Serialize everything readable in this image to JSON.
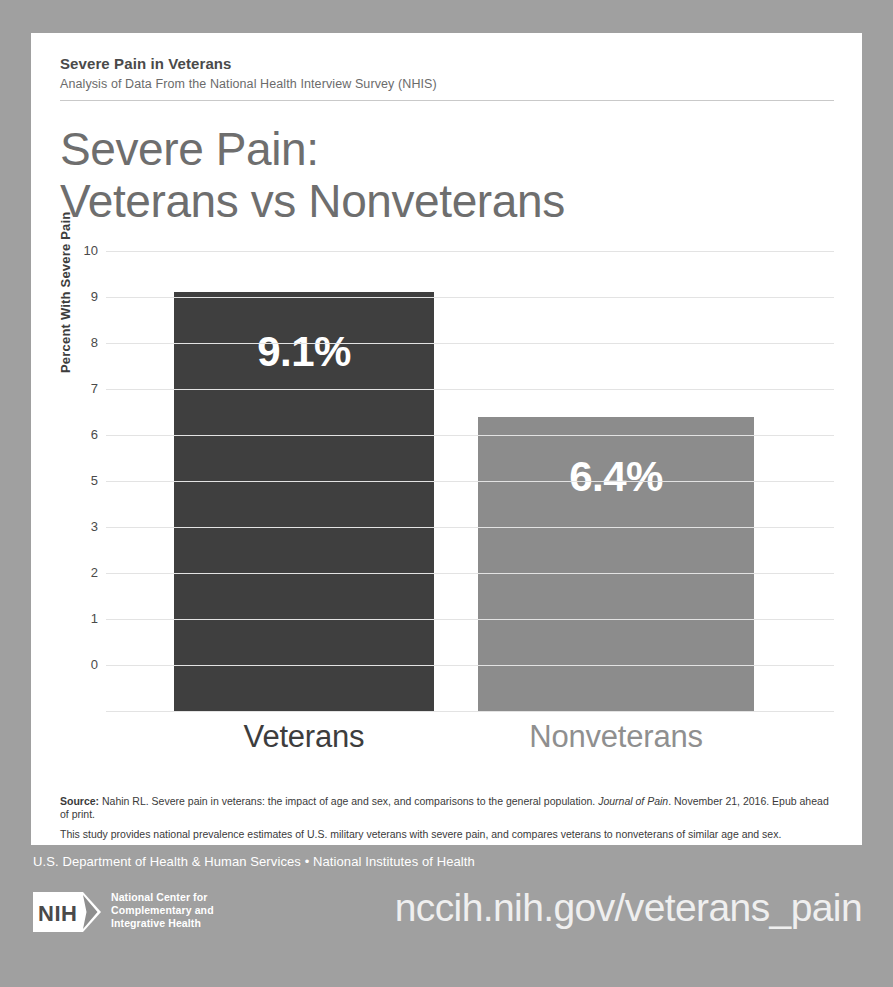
{
  "header": {
    "kicker": "Severe Pain in Veterans",
    "subkicker": "Analysis of Data From the National Health Interview Survey (NHIS)"
  },
  "title": {
    "line1": "Severe Pain:",
    "line2": "Veterans vs Nonveterans"
  },
  "chart_data": {
    "type": "bar",
    "title": "Severe Pain: Veterans vs Nonveterans",
    "categories": [
      "Veterans",
      "Nonveterans"
    ],
    "values": [
      9.1,
      6.4
    ],
    "value_labels": [
      "9.1%",
      "6.4%"
    ],
    "xlabel": "",
    "ylabel": "Percent With Severe Pain",
    "ylim": [
      0,
      10
    ],
    "yticks": [
      10,
      9,
      8,
      7,
      6,
      5,
      3,
      2,
      1,
      0
    ],
    "ytick_values": [
      10,
      9,
      8,
      7,
      6,
      5,
      4,
      3,
      2,
      1,
      0
    ],
    "grid": true,
    "legend": "none",
    "bar_colors": [
      "#3f3f3f",
      "#8c8c8c"
    ],
    "label_colors": [
      "#3d3d3d",
      "#8f8f8f"
    ]
  },
  "source": {
    "label": "Source:",
    "citation_part1": " Nahin RL. Severe pain in veterans: the impact of age and sex, and comparisons to the general population. ",
    "journal": "Journal of Pain",
    "citation_part2": ". November 21, 2016. Epub ahead of print.",
    "note": "This study provides national prevalence estimates of U.S. military veterans with severe pain, and compares veterans to nonveterans of similar age and sex."
  },
  "footer": {
    "agency": "U.S. Department of Health & Human Services • National Institutes of Health",
    "logo_mark": "NIH",
    "logo_line1": "National Center for",
    "logo_line2": "Complementary and",
    "logo_line3": "Integrative Health",
    "url": "nccih.nih.gov/veterans_pain"
  }
}
